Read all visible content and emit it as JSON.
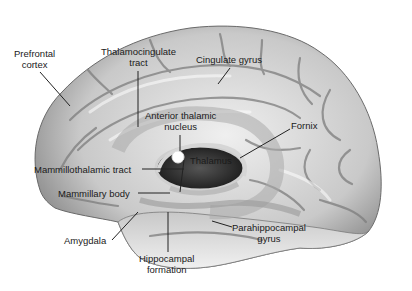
{
  "figure": {
    "colors": {
      "background": "#ffffff",
      "brain_light": "#e8e8e8",
      "brain_mid": "#b4b4b4",
      "brain_dark": "#5a5a5a",
      "ventricle": "#2a2a2a",
      "label_text": "#1a1a1a",
      "leader_line": "#222222"
    }
  },
  "labels": [
    {
      "id": "prefrontal-cortex",
      "lines": [
        "Prefrontal",
        "cortex"
      ]
    },
    {
      "id": "thalamocingulate-tract",
      "lines": [
        "Thalamocingulate",
        "tract"
      ]
    },
    {
      "id": "cingulate-gyrus",
      "lines": [
        "Cingulate gyrus"
      ]
    },
    {
      "id": "anterior-thalamic-nucleus",
      "lines": [
        "Anterior thalamic",
        "nucleus"
      ]
    },
    {
      "id": "fornix",
      "lines": [
        "Fornix"
      ]
    },
    {
      "id": "thalamus",
      "lines": [
        "Thalamus"
      ]
    },
    {
      "id": "mammillothalamic-tract",
      "lines": [
        "Mammillothalamic tract"
      ]
    },
    {
      "id": "mammillary-body",
      "lines": [
        "Mammillary body"
      ]
    },
    {
      "id": "amygdala",
      "lines": [
        "Amygdala"
      ]
    },
    {
      "id": "hippocampal-formation",
      "lines": [
        "Hippocampal",
        "formation"
      ]
    },
    {
      "id": "parahippocampal-gyrus",
      "lines": [
        "Parahippocampal",
        "gyrus"
      ]
    }
  ]
}
